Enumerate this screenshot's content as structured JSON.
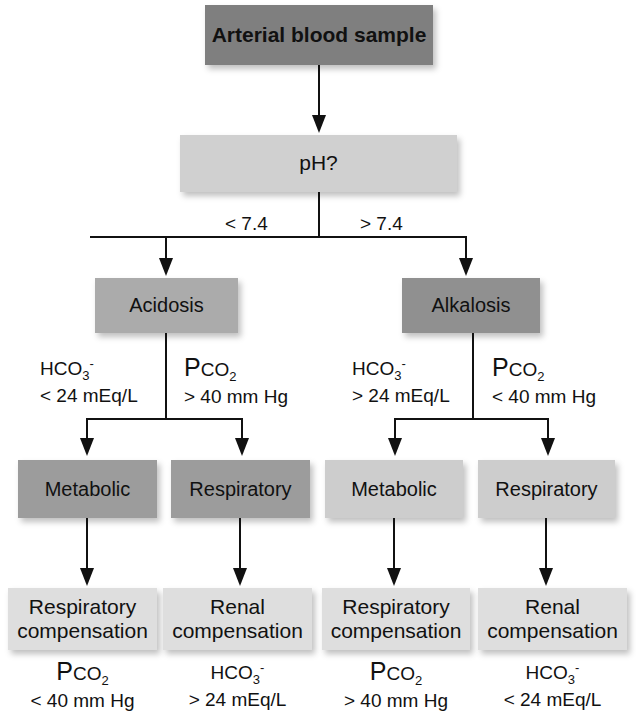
{
  "title": "Arterial blood sample",
  "question": "pH?",
  "branches": {
    "left_threshold": "< 7.4",
    "right_threshold": "> 7.4"
  },
  "colors": {
    "top_box": "#7f7f7f",
    "ph_box": "#d0d0d0",
    "acidosis_box": "#ababab",
    "alkalosis_box": "#909090",
    "acid_type_box": "#9c9c9c",
    "alk_type_box": "#cdcdcd",
    "comp_box": "#dedede",
    "line": "#111111"
  },
  "acidosis": {
    "label": "Acidosis",
    "left_condition": {
      "species": "HCO",
      "sub": "3",
      "sup": "-",
      "value": "< 24 mEq/L"
    },
    "right_condition": {
      "species_p": "P",
      "species_rest": "CO",
      "sub": "2",
      "value": "> 40 mm Hg"
    },
    "metabolic": {
      "label": "Metabolic",
      "compensation_line1": "Respiratory",
      "compensation_line2": "compensation",
      "result": {
        "species_p": "P",
        "species_rest": "CO",
        "sub": "2",
        "value": "< 40 mm Hg"
      }
    },
    "respiratory": {
      "label": "Respiratory",
      "compensation_line1": "Renal",
      "compensation_line2": "compensation",
      "result": {
        "species": "HCO",
        "sub": "3",
        "sup": "-",
        "value": "> 24 mEq/L"
      }
    }
  },
  "alkalosis": {
    "label": "Alkalosis",
    "left_condition": {
      "species": "HCO",
      "sub": "3",
      "sup": "-",
      "value": "> 24 mEq/L"
    },
    "right_condition": {
      "species_p": "P",
      "species_rest": "CO",
      "sub": "2",
      "value": "< 40 mm Hg"
    },
    "metabolic": {
      "label": "Metabolic",
      "compensation_line1": "Respiratory",
      "compensation_line2": "compensation",
      "result": {
        "species_p": "P",
        "species_rest": "CO",
        "sub": "2",
        "value": "> 40 mm Hg"
      }
    },
    "respiratory": {
      "label": "Respiratory",
      "compensation_line1": "Renal",
      "compensation_line2": "compensation",
      "result": {
        "species": "HCO",
        "sub": "3",
        "sup": "-",
        "value": "< 24 mEq/L"
      }
    }
  }
}
